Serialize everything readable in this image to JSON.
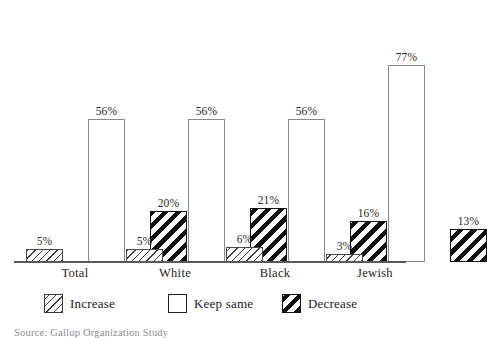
{
  "chart_data": {
    "type": "bar",
    "title": "",
    "xlabel": "",
    "ylabel": "",
    "ylim": [
      0,
      100
    ],
    "grid": false,
    "legend_position": "bottom",
    "categories": [
      "Total",
      "White",
      "Black",
      "Jewish"
    ],
    "series": [
      {
        "name": "Increase",
        "values": [
          5,
          5,
          6,
          3
        ],
        "labels": [
          "5%",
          "5%",
          "6%",
          "3%"
        ]
      },
      {
        "name": "Keep same",
        "values": [
          56,
          56,
          56,
          77
        ],
        "labels": [
          "56%",
          "56%",
          "56%",
          "77%"
        ]
      },
      {
        "name": "Decrease",
        "values": [
          20,
          21,
          16,
          13
        ],
        "labels": [
          "20%",
          "21%",
          "16%",
          "13%"
        ]
      }
    ]
  },
  "legend": {
    "items": [
      {
        "label": "Increase",
        "swatch": "hatch-thin-icon"
      },
      {
        "label": "Keep same",
        "swatch": "empty-square-icon"
      },
      {
        "label": "Decrease",
        "swatch": "hatch-bold-icon"
      }
    ]
  },
  "source": {
    "text": "Source: Gallup Organization Study"
  },
  "colors": {
    "background": "#ffffff",
    "axis": "#59595b",
    "hatch": "#0f0f0f",
    "keep_outline": "#8a8a8c",
    "text": "#1a1a1a"
  }
}
